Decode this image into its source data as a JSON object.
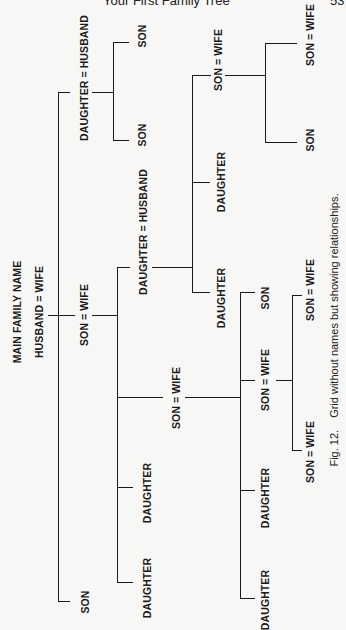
{
  "header": {
    "running_title": "Your First Family Tree",
    "page_number": "53"
  },
  "tree": {
    "root": {
      "family_name": "MAIN FAMILY NAME",
      "couple": "HUSBAND = WIFE"
    },
    "gen1": {
      "daughter_husband": "DAUGHTER = HUSBAND",
      "son_wife": "SON = WIFE",
      "son": "SON"
    },
    "gen2_from_daughter": {
      "son_top": "SON",
      "son_bottom": "SON"
    },
    "gen2_from_son": {
      "daughter_husband": "DAUGHTER = HUSBAND",
      "son_wife": "SON = WIFE",
      "daughter_a": "DAUGHTER",
      "daughter_b": "DAUGHTER"
    },
    "gen3_from_daughter_husband": {
      "son_wife": "SON = WIFE",
      "daughter_a": "DAUGHTER",
      "daughter_b": "DAUGHTER"
    },
    "gen4_from_son_wife_top": {
      "son_wife": "SON = WIFE",
      "son": "SON"
    },
    "gen3_from_son_wife": {
      "son": "SON",
      "son_wife": "SON = WIFE",
      "daughter_a": "DAUGHTER",
      "daughter_b": "DAUGHTER"
    },
    "gen4_from_son_wife_bottom": {
      "son_wife_a": "SON = WIFE",
      "son_wife_b": "SON = WIFE"
    }
  },
  "caption": {
    "fig_label": "Fig. 12.",
    "text": "Grid without names but showing relationships."
  }
}
